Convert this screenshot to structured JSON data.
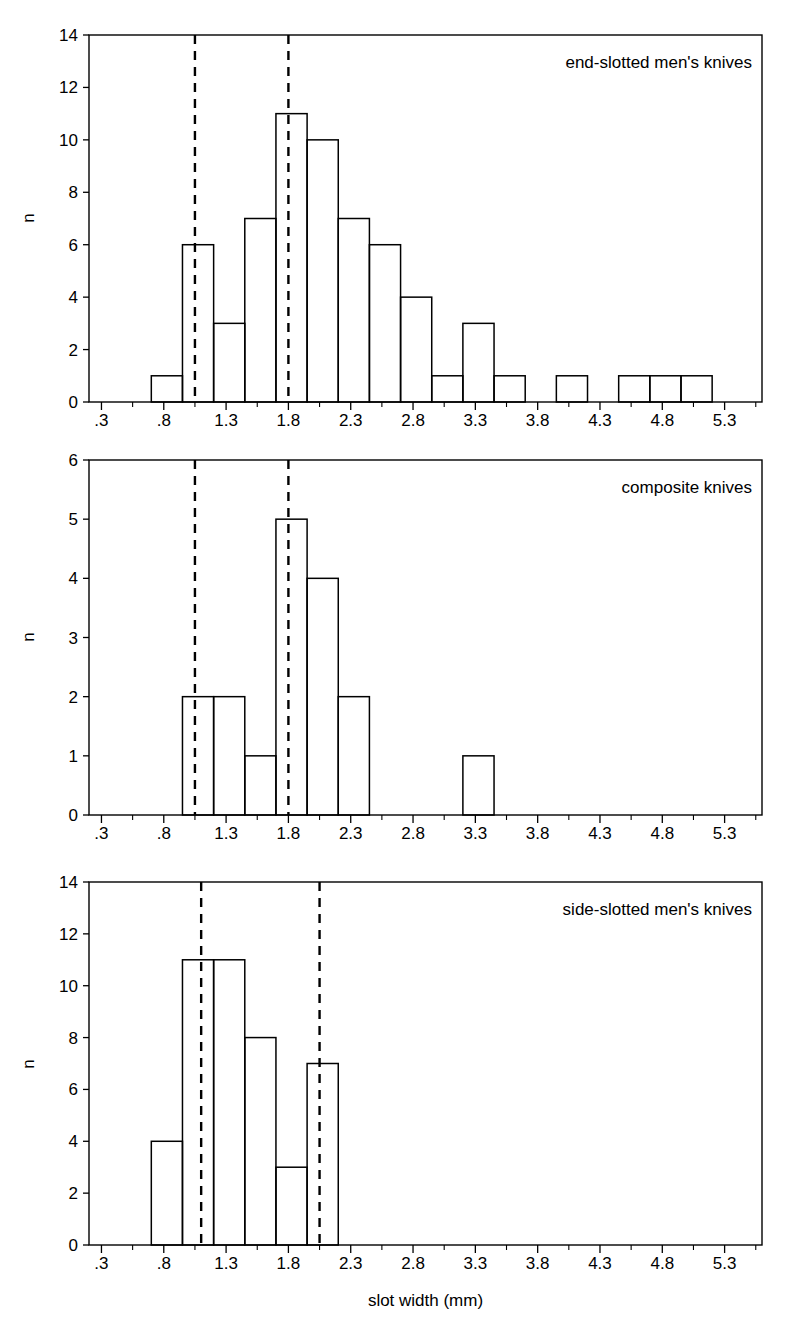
{
  "figure": {
    "xlabel": "slot width (mm)",
    "ylabel": "n",
    "x_tick_labels": [
      ".3",
      ".8",
      "1.3",
      "1.8",
      "2.3",
      "2.8",
      "3.3",
      "3.8",
      "4.3",
      "4.8",
      "5.3"
    ],
    "x_tick_values": [
      0.3,
      0.8,
      1.3,
      1.8,
      2.3,
      2.8,
      3.3,
      3.8,
      4.3,
      4.8,
      5.3
    ],
    "xlim": [
      0.2,
      5.6
    ],
    "line_color": "#000000",
    "background_color": "#ffffff"
  },
  "panels": [
    {
      "label": "end-slotted men's knives",
      "ylabel": "n",
      "y_tick_labels": [
        "0",
        "2",
        "4",
        "6",
        "8",
        "10",
        "12",
        "14"
      ],
      "y_tick_values": [
        0,
        2,
        4,
        6,
        8,
        10,
        12,
        14
      ]
    },
    {
      "label": "composite knives",
      "ylabel": "n",
      "y_tick_labels": [
        "0",
        "1",
        "2",
        "3",
        "4",
        "5",
        "6"
      ],
      "y_tick_values": [
        0,
        1,
        2,
        3,
        4,
        5,
        6
      ]
    },
    {
      "label": "side-slotted men's knives",
      "ylabel": "n",
      "y_tick_labels": [
        "0",
        "2",
        "4",
        "6",
        "8",
        "10",
        "12",
        "14"
      ],
      "y_tick_values": [
        0,
        2,
        4,
        6,
        8,
        10,
        12,
        14
      ]
    }
  ],
  "chart_data": [
    {
      "type": "bar",
      "title": "end-slotted men's knives",
      "xlabel": "slot width (mm)",
      "ylabel": "n",
      "xlim": [
        0.2,
        5.6
      ],
      "ylim": [
        0,
        14
      ],
      "bin_width": 0.25,
      "grid": false,
      "legend": null,
      "bin_starts": [
        0.7,
        0.95,
        1.2,
        1.45,
        1.7,
        1.95,
        2.2,
        2.45,
        2.7,
        2.95,
        3.2,
        3.45,
        3.7,
        3.95,
        4.2,
        4.45,
        4.7,
        4.95
      ],
      "values": [
        1,
        6,
        3,
        7,
        11,
        10,
        7,
        6,
        4,
        1,
        3,
        1,
        0,
        1,
        0,
        1,
        1,
        1
      ],
      "x_tick_labels": [
        ".3",
        ".8",
        "1.3",
        "1.8",
        "2.3",
        "2.8",
        "3.3",
        "3.8",
        "4.3",
        "4.8",
        "5.3"
      ],
      "y_tick_labels": [
        "0",
        "2",
        "4",
        "6",
        "8",
        "10",
        "12",
        "14"
      ],
      "reference_lines": [
        1.05,
        1.8
      ],
      "annotations": [
        "end-slotted men's knives"
      ]
    },
    {
      "type": "bar",
      "title": "composite knives",
      "xlabel": "slot width (mm)",
      "ylabel": "n",
      "xlim": [
        0.2,
        5.6
      ],
      "ylim": [
        0,
        6
      ],
      "bin_width": 0.25,
      "grid": false,
      "legend": null,
      "bin_starts": [
        0.95,
        1.2,
        1.45,
        1.7,
        1.95,
        2.2,
        2.45,
        2.7,
        2.95,
        3.2
      ],
      "values": [
        2,
        2,
        1,
        5,
        4,
        2,
        0,
        0,
        0,
        1
      ],
      "x_tick_labels": [
        ".3",
        ".8",
        "1.3",
        "1.8",
        "2.3",
        "2.8",
        "3.3",
        "3.8",
        "4.3",
        "4.8",
        "5.3"
      ],
      "y_tick_labels": [
        "0",
        "1",
        "2",
        "3",
        "4",
        "5",
        "6"
      ],
      "reference_lines": [
        1.05,
        1.8
      ],
      "annotations": [
        "composite knives"
      ]
    },
    {
      "type": "bar",
      "title": "side-slotted men's knives",
      "xlabel": "slot width (mm)",
      "ylabel": "n",
      "xlim": [
        0.2,
        5.6
      ],
      "ylim": [
        0,
        14
      ],
      "bin_width": 0.25,
      "grid": false,
      "legend": null,
      "bin_starts": [
        0.7,
        0.95,
        1.2,
        1.45,
        1.7,
        1.95
      ],
      "values": [
        4,
        11,
        11,
        8,
        3,
        7
      ],
      "x_tick_labels": [
        ".3",
        ".8",
        "1.3",
        "1.8",
        "2.3",
        "2.8",
        "3.3",
        "3.8",
        "4.3",
        "4.8",
        "5.3"
      ],
      "y_tick_labels": [
        "0",
        "2",
        "4",
        "6",
        "8",
        "10",
        "12",
        "14"
      ],
      "reference_lines": [
        1.1,
        2.05
      ],
      "annotations": [
        "side-slotted men's knives"
      ]
    }
  ]
}
